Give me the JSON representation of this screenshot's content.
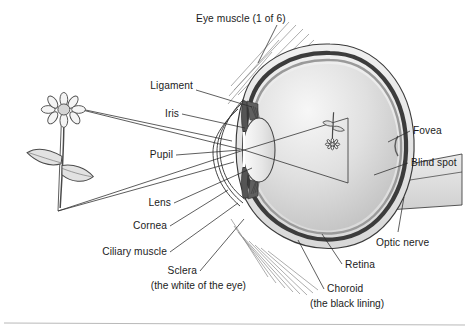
{
  "figure": {
    "background_color": "#ffffff",
    "ink_color": "#1c1c1c"
  },
  "labels": {
    "eye_muscle": "Eye muscle (1 of 6)",
    "ligament": "Ligament",
    "iris": "Iris",
    "pupil": "Pupil",
    "lens": "Lens",
    "cornea": "Cornea",
    "ciliary_muscle": "Ciliary muscle",
    "sclera": "Sclera",
    "sclera_note": "(the white of the eye)",
    "choroid": "Choroid",
    "choroid_note": "(the black lining)",
    "retina": "Retina",
    "optic_nerve": "Optic nerve",
    "blind_spot": "Blind spot",
    "fovea": "Fovea"
  },
  "objects": {
    "flower_label": "daisy-flower-object",
    "flower_image_label": "inverted-flower-retinal-image"
  },
  "colors": {
    "sclera_fill": "#e9e9e9",
    "choroid_fill": "#4a4a4a",
    "retina_fill": "#c9c9c9",
    "vitreous_light": "#f2f2f2",
    "vitreous_dark": "#c6c6c6",
    "iris_fill": "#6d6d6d",
    "lens_fill": "#ececec",
    "optic_nerve_fill": "#dcdcdc",
    "muscle_stroke": "#8a8a8a",
    "outline": "#3a3a3a",
    "ray_line": "#333333",
    "footer_rule": "#b9b9b9"
  }
}
